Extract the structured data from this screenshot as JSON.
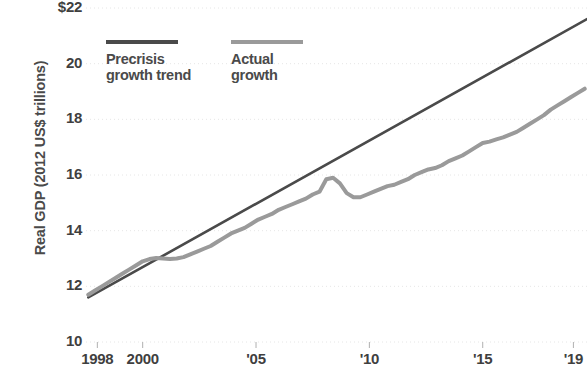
{
  "chart_data": {
    "type": "line",
    "title": "",
    "xlabel": "",
    "ylabel": "Real GDP (2012 US$ trillions)",
    "ylim": [
      10,
      22
    ],
    "xlim": [
      1997.5,
      2019.6
    ],
    "grid": true,
    "legend_position": "top-left-inside",
    "y_ticks": [
      "$22",
      "20",
      "18",
      "16",
      "14",
      "12",
      "10"
    ],
    "y_tick_values": [
      22,
      20,
      18,
      16,
      14,
      12,
      10
    ],
    "x_ticks": [
      "1998",
      "2000",
      "'05",
      "'10",
      "'15",
      "'19"
    ],
    "x_tick_values": [
      1998,
      2000,
      2005,
      2010,
      2015,
      2019
    ],
    "series": [
      {
        "name": "Precrisis growth trend",
        "color": "#4a4a4a",
        "x": [
          1997.6,
          2019.6
        ],
        "values": [
          11.6,
          21.6
        ]
      },
      {
        "name": "Actual growth",
        "color": "#9a9a9a",
        "x": [
          1997.6,
          1997.9,
          1998.2,
          1998.5,
          1998.8,
          1999.1,
          1999.4,
          1999.7,
          2000.0,
          2000.3,
          2000.6,
          2000.9,
          2001.2,
          2001.5,
          2001.8,
          2002.1,
          2002.4,
          2002.7,
          2003.0,
          2003.3,
          2003.6,
          2003.9,
          2004.2,
          2004.5,
          2004.8,
          2005.1,
          2005.4,
          2005.7,
          2006.0,
          2006.3,
          2006.6,
          2006.9,
          2007.2,
          2007.5,
          2007.8,
          2008.1,
          2008.4,
          2008.7,
          2009.0,
          2009.3,
          2009.6,
          2009.9,
          2010.2,
          2010.5,
          2010.8,
          2011.1,
          2011.4,
          2011.7,
          2012.0,
          2012.3,
          2012.6,
          2012.9,
          2013.2,
          2013.5,
          2013.8,
          2014.1,
          2014.4,
          2014.7,
          2015.0,
          2015.3,
          2015.6,
          2015.9,
          2016.2,
          2016.5,
          2016.8,
          2017.1,
          2017.4,
          2017.7,
          2018.0,
          2018.3,
          2018.6,
          2018.9,
          2019.2,
          2019.5
        ],
        "values": [
          11.7,
          11.85,
          12.0,
          12.15,
          12.3,
          12.45,
          12.6,
          12.75,
          12.9,
          12.98,
          13.02,
          13.0,
          12.98,
          13.0,
          13.05,
          13.15,
          13.25,
          13.35,
          13.45,
          13.6,
          13.75,
          13.9,
          14.0,
          14.1,
          14.25,
          14.4,
          14.5,
          14.6,
          14.75,
          14.85,
          14.95,
          15.05,
          15.15,
          15.3,
          15.4,
          15.85,
          15.9,
          15.7,
          15.35,
          15.2,
          15.2,
          15.3,
          15.4,
          15.5,
          15.6,
          15.65,
          15.75,
          15.85,
          16.0,
          16.1,
          16.2,
          16.25,
          16.35,
          16.5,
          16.6,
          16.7,
          16.85,
          17.0,
          17.15,
          17.2,
          17.28,
          17.35,
          17.45,
          17.55,
          17.7,
          17.85,
          18.0,
          18.15,
          18.35,
          18.5,
          18.65,
          18.8,
          18.95,
          19.1
        ]
      }
    ],
    "legend": [
      {
        "label_line1": "Precrisis",
        "label_line2": "growth trend",
        "color": "#4a4a4a"
      },
      {
        "label_line1": "Actual",
        "label_line2": "growth",
        "color": "#9a9a9a"
      }
    ],
    "colors": {
      "trend_line": "#4a4a4a",
      "actual_line": "#9a9a9a",
      "gridline": "#e6e6e6",
      "tick_mark": "#b0b0b0",
      "text": "#3f3f3f",
      "background": "#ffffff"
    }
  }
}
